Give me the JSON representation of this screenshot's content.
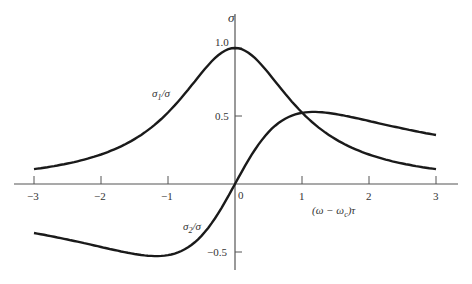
{
  "chart_data": {
    "type": "line",
    "title": "",
    "xlabel": "(ω − ω_c)τ",
    "ylabel": "σ",
    "xlim": [
      -3,
      3
    ],
    "ylim": [
      -0.5,
      1.0
    ],
    "x_ticks": [
      "−3",
      "−2",
      "−1",
      "0",
      "1",
      "2",
      "3"
    ],
    "y_ticks": [
      "1.0",
      "0.5",
      "−0.5"
    ],
    "grid": false,
    "legend": "inline labels",
    "x": [
      -3.0,
      -2.5,
      -2.0,
      -1.5,
      -1.0,
      -0.5,
      0.0,
      0.5,
      1.0,
      1.5,
      2.0,
      2.5,
      3.0
    ],
    "series": [
      {
        "name": "σ1/σ",
        "values": [
          0.1,
          0.14,
          0.2,
          0.31,
          0.5,
          0.8,
          1.0,
          0.8,
          0.5,
          0.31,
          0.2,
          0.14,
          0.1
        ]
      },
      {
        "name": "σ2/σ",
        "values": [
          -0.3,
          -0.34,
          -0.4,
          -0.46,
          -0.5,
          -0.4,
          0.0,
          0.4,
          0.5,
          0.46,
          0.4,
          0.34,
          0.3
        ]
      }
    ]
  },
  "labels": {
    "y_axis": "σ",
    "x_axis": "(ω − ω",
    "x_axis_sub": "c",
    "x_axis_tail": ")τ",
    "sigma1": "σ",
    "sigma1_sub": "1",
    "sigma1_tail": "/σ",
    "sigma2": "σ",
    "sigma2_sub": "2",
    "sigma2_tail": "/σ",
    "origin": "0"
  }
}
